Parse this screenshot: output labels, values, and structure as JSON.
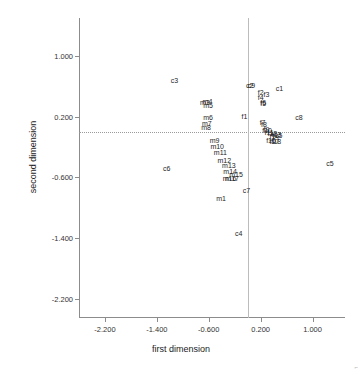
{
  "chart_data": {
    "type": "scatter",
    "title": "",
    "xlabel": "first dimension",
    "ylabel": "second dimension",
    "xlim": [
      -2.6,
      1.5
    ],
    "ylim": [
      -2.45,
      1.5
    ],
    "xticks": [
      "-2.200",
      "-1.400",
      "-0.600",
      "0.200",
      "1.000"
    ],
    "xtick_values": [
      -2.2,
      -1.4,
      -0.6,
      0.2,
      1.0
    ],
    "yticks": [
      "1.000",
      "0.200",
      "-0.600",
      "-1.400",
      "-2.200"
    ],
    "ytick_values": [
      1.0,
      0.2,
      -0.6,
      -1.4,
      -2.2
    ],
    "grid": false,
    "legend": null,
    "reference_lines": {
      "horizontal_y": 0.0,
      "vertical_x": 0.0,
      "horizontal_style": "dotted",
      "vertical_style": "solid"
    },
    "marker_style": "text-label-only",
    "label_color": "#1e1e1e",
    "axis_color": "#8c8c8c",
    "points": [
      {
        "label": "c1",
        "x": 0.49,
        "y": 0.58
      },
      {
        "label": "c2",
        "x": 0.03,
        "y": 0.62
      },
      {
        "label": "c9",
        "x": 0.06,
        "y": 0.62
      },
      {
        "label": "c3",
        "x": -1.13,
        "y": 0.68
      },
      {
        "label": "c4",
        "x": -0.14,
        "y": -1.33
      },
      {
        "label": "c5",
        "x": 1.27,
        "y": -0.41
      },
      {
        "label": "c6",
        "x": -1.25,
        "y": -0.47
      },
      {
        "label": "c7",
        "x": -0.02,
        "y": -0.77
      },
      {
        "label": "c8",
        "x": 0.79,
        "y": 0.19
      },
      {
        "label": "f1",
        "x": -0.05,
        "y": 0.21
      },
      {
        "label": "f2",
        "x": 0.2,
        "y": 0.53
      },
      {
        "label": "f3",
        "x": 0.29,
        "y": 0.5
      },
      {
        "label": "f4",
        "x": 0.2,
        "y": 0.46
      },
      {
        "label": "f5",
        "x": 0.24,
        "y": 0.38
      },
      {
        "label": "f6",
        "x": 0.24,
        "y": 0.39
      },
      {
        "label": "f7",
        "x": 0.23,
        "y": 0.13
      },
      {
        "label": "f8",
        "x": 0.25,
        "y": 0.11
      },
      {
        "label": "f9",
        "x": 0.29,
        "y": 0.04
      },
      {
        "label": "f10",
        "x": 0.3,
        "y": 0.02
      },
      {
        "label": "f11",
        "x": 0.33,
        "y": 0.0
      },
      {
        "label": "f12",
        "x": 0.38,
        "y": -0.01
      },
      {
        "label": "f13",
        "x": 0.44,
        "y": -0.03
      },
      {
        "label": "f14",
        "x": 0.41,
        "y": -0.06
      },
      {
        "label": "f15",
        "x": 0.46,
        "y": -0.04
      },
      {
        "label": "f16",
        "x": 0.36,
        "y": -0.1
      },
      {
        "label": "f17",
        "x": 0.41,
        "y": -0.12
      },
      {
        "label": "f18",
        "x": 0.44,
        "y": -0.12
      },
      {
        "label": "m1",
        "x": -0.41,
        "y": -0.87
      },
      {
        "label": "m3",
        "x": -0.66,
        "y": 0.4
      },
      {
        "label": "m4",
        "x": -0.62,
        "y": 0.41
      },
      {
        "label": "m5",
        "x": -0.61,
        "y": 0.35
      },
      {
        "label": "m6",
        "x": -0.61,
        "y": 0.2
      },
      {
        "label": "m7",
        "x": -0.63,
        "y": 0.12
      },
      {
        "label": "m8",
        "x": -0.64,
        "y": 0.06
      },
      {
        "label": "m9",
        "x": -0.51,
        "y": -0.11
      },
      {
        "label": "m10",
        "x": -0.47,
        "y": -0.19
      },
      {
        "label": "m11",
        "x": -0.42,
        "y": -0.27
      },
      {
        "label": "m12",
        "x": -0.36,
        "y": -0.37
      },
      {
        "label": "m13",
        "x": -0.29,
        "y": -0.44
      },
      {
        "label": "m14",
        "x": -0.27,
        "y": -0.52
      },
      {
        "label": "m15",
        "x": -0.18,
        "y": -0.55
      },
      {
        "label": "m16",
        "x": -0.28,
        "y": -0.61
      },
      {
        "label": "m17",
        "x": -0.24,
        "y": -0.61
      }
    ]
  },
  "corner": {
    "mark": "⌐"
  }
}
